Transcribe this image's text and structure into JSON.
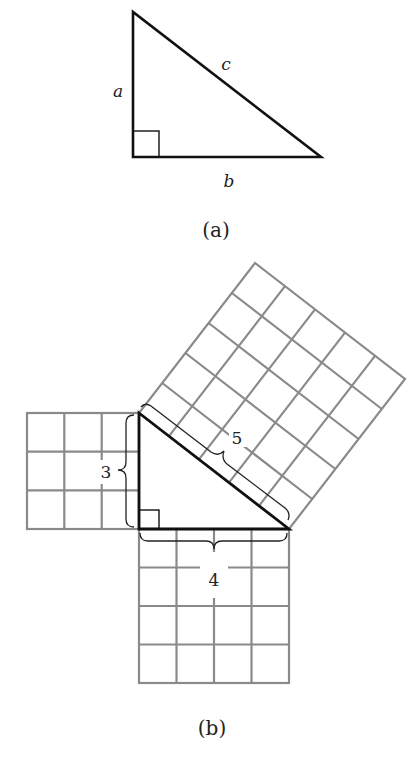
{
  "figure_a": {
    "caption": "(a)",
    "side_labels": {
      "a": "a",
      "b": "b",
      "c": "c"
    },
    "vertices": {
      "top": [
        133,
        12
      ],
      "right_angle": [
        133,
        157
      ],
      "right": [
        321,
        157
      ]
    }
  },
  "figure_b": {
    "caption": "(b)",
    "side_lengths": {
      "short_leg": "3",
      "long_leg": "4",
      "hypotenuse": "5"
    },
    "cell_size_px": 37.5,
    "squares": [
      {
        "name": "left-square",
        "cells": "3x3"
      },
      {
        "name": "bottom-square",
        "cells": "4x4"
      },
      {
        "name": "hypotenuse-square",
        "cells": "5x5"
      }
    ]
  },
  "colors": {
    "triangle_stroke": "#111111",
    "grid_stroke": "#8a8a8a",
    "text": "#222222"
  }
}
